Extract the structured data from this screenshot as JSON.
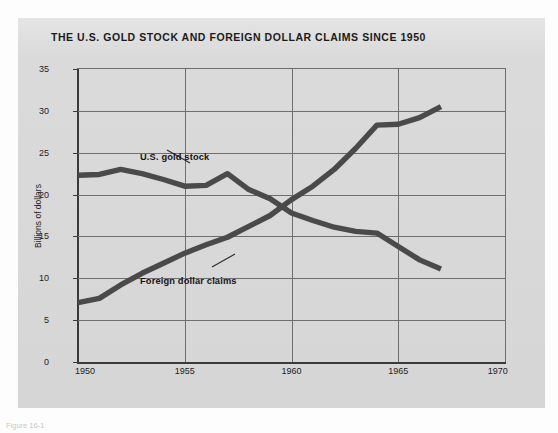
{
  "figure": {
    "title": "THE U.S. GOLD STOCK AND FOREIGN DOLLAR CLAIMS SINCE 1950",
    "caption": "Figure 16-1",
    "panel_color": "#d9d9d9",
    "line_color": "#4a4a4a"
  },
  "axes": {
    "ylabel": "Billions of dollars",
    "yticks": [
      0,
      5,
      10,
      15,
      20,
      25,
      30,
      35
    ],
    "ytick_labels": [
      "0",
      "5",
      "10",
      "15",
      "20",
      "25",
      "30",
      "35"
    ],
    "xticks": [
      1950,
      1955,
      1960,
      1965,
      1970
    ],
    "xtick_labels": [
      "1950",
      "1955",
      "1960",
      "1965",
      "1970"
    ],
    "xlim": [
      1950,
      1970
    ],
    "ylim": [
      0,
      35
    ],
    "grid": "both"
  },
  "annotations": [
    {
      "name": "gold-stock-label",
      "text": "U.S. gold stock",
      "x": 1955.6,
      "y": 24.6
    },
    {
      "name": "foreign-claims-label",
      "text": "Foreign dollar claims",
      "x": 1957.0,
      "y": 12.6
    }
  ],
  "chart_data": {
    "type": "line",
    "title": "THE U.S. GOLD STOCK AND FOREIGN DOLLAR CLAIMS SINCE 1950",
    "xlabel": "",
    "ylabel": "Billions of dollars",
    "xlim": [
      1950,
      1970
    ],
    "ylim": [
      0,
      35
    ],
    "grid": true,
    "legend": "inline-annotations",
    "x": [
      1950,
      1951,
      1952,
      1953,
      1954,
      1955,
      1956,
      1957,
      1958,
      1959,
      1960,
      1961,
      1962,
      1963,
      1964,
      1965,
      1966,
      1967
    ],
    "series": [
      {
        "name": "U.S. gold stock",
        "values": [
          22.3,
          22.4,
          23.0,
          22.5,
          21.8,
          21.0,
          21.1,
          22.5,
          20.6,
          19.5,
          17.8,
          16.9,
          16.1,
          15.6,
          15.4,
          13.8,
          12.2,
          11.1
        ]
      },
      {
        "name": "Foreign dollar claims",
        "values": [
          7.1,
          7.6,
          9.2,
          10.6,
          11.8,
          13.0,
          14.0,
          14.9,
          16.2,
          17.5,
          19.4,
          21.0,
          23.0,
          25.5,
          28.3,
          28.4,
          29.2,
          30.5
        ]
      }
    ]
  }
}
